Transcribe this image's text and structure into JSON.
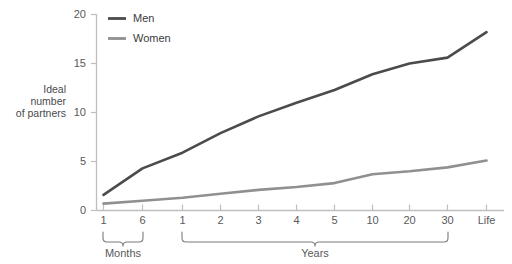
{
  "chart_data": {
    "type": "line",
    "title": "",
    "subtitle": "",
    "xlabel": "",
    "ylabel": "Ideal number of partners",
    "ylabel_lines": [
      "Ideal",
      "number",
      "of partners"
    ],
    "categories": [
      "1",
      "6",
      "1",
      "2",
      "3",
      "4",
      "5",
      "10",
      "20",
      "30",
      "Life"
    ],
    "x_tick_labels": [
      "1",
      "6",
      "1",
      "2",
      "3",
      "4",
      "5",
      "10",
      "20",
      "30",
      "Life"
    ],
    "y_tick_labels": [
      "0",
      "5",
      "10",
      "15",
      "20"
    ],
    "y_ticks": [
      0,
      5,
      10,
      15,
      20
    ],
    "ylim": [
      0,
      20
    ],
    "grid": false,
    "legend_position": "top-left",
    "group_labels": [
      {
        "label": "Months",
        "from_index": 0,
        "to_index": 1
      },
      {
        "label": "Years",
        "from_index": 2,
        "to_index": 9
      }
    ],
    "series": [
      {
        "name": "Men",
        "color": "#4b4b4d",
        "values": [
          1.6,
          4.3,
          5.9,
          7.9,
          9.6,
          11.0,
          12.3,
          13.9,
          15.0,
          15.6,
          18.2
        ]
      },
      {
        "name": "Women",
        "color": "#8e9092",
        "values": [
          0.7,
          1.0,
          1.3,
          1.7,
          2.1,
          2.4,
          2.8,
          3.7,
          4.0,
          4.4,
          5.1
        ]
      }
    ]
  },
  "legend": {
    "items": [
      {
        "label": "Men",
        "color": "#4b4b4d"
      },
      {
        "label": "Women",
        "color": "#8e9092"
      }
    ]
  },
  "axis": {
    "y_title_lines": [
      "Ideal",
      "number",
      "of partners"
    ]
  },
  "colors": {
    "men": "#4b4b4d",
    "women": "#8e9092",
    "axis": "#bcbec0",
    "text": "#58595b",
    "background": "#ffffff"
  }
}
